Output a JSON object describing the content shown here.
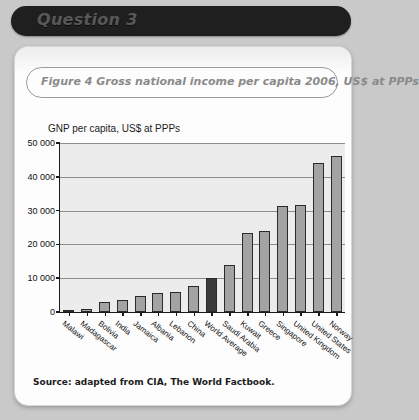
{
  "banner": {
    "label": "Question 3"
  },
  "caption": {
    "text": "Figure 4  Gross national income per capita 2006, US$ at PPPs"
  },
  "source": {
    "text": "Source:  adapted from CIA, The World Factbook."
  },
  "colors": {
    "page_background": "#c9c9c9",
    "card_background": "#fdfdfd",
    "banner_background": "#201f1f",
    "banner_text": "#585858",
    "caption_text": "#8a8a8a",
    "plot_background": "#ececec",
    "bar_fill": "#a3a3a3",
    "bar_highlight_fill": "#3a3a3a",
    "axis": "#1a1a1a",
    "gridline": "#8e8e8e"
  },
  "chart_data": {
    "type": "bar",
    "title": "GNP per capita, US$ at PPPs",
    "xlabel": "",
    "ylabel": "",
    "ylim": [
      0,
      50000
    ],
    "yticks": [
      0,
      10000,
      20000,
      30000,
      40000,
      50000
    ],
    "ytick_labels": [
      "0",
      "10 000",
      "20 000",
      "30 000",
      "40 000",
      "50 000"
    ],
    "grid": true,
    "legend": "none",
    "highlight_category": "World Average",
    "categories": [
      "Malawi",
      "Madagascar",
      "Bolivia",
      "India",
      "Jamaica",
      "Albania",
      "Lebanon",
      "China",
      "World Average",
      "Saudi Arabia",
      "Kuwait",
      "Greece",
      "Singapore",
      "United Kingdom",
      "United States",
      "Norway"
    ],
    "values": [
      600,
      900,
      3000,
      3700,
      4600,
      5700,
      5800,
      7700,
      10000,
      13800,
      23500,
      24000,
      31400,
      31600,
      44000,
      46300
    ]
  }
}
